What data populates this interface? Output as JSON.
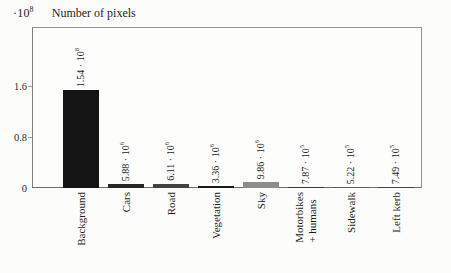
{
  "chart_data": {
    "type": "bar",
    "ylabel": "Number of pixels",
    "xlabel": "",
    "grid": false,
    "legend": "none",
    "y_axis": {
      "multiplier_base": "·10",
      "multiplier_exp": "8",
      "ticks": [
        {
          "label": "0",
          "value": 0
        },
        {
          "label": "0.8",
          "value": 80000000
        },
        {
          "label": "1.6",
          "value": 160000000
        }
      ],
      "ylim": [
        0,
        252000000
      ]
    },
    "categories": [
      "Background",
      "Cars",
      "Road",
      "Vegetation",
      "Sky",
      "Motorbikes + humans",
      "Sidewalk",
      "Left kerb"
    ],
    "values": [
      154000000,
      5880000,
      6110000,
      3360000,
      9860000,
      787000,
      522000,
      749000
    ],
    "bars": [
      {
        "category_lines": [
          "Background"
        ],
        "value": 154000000,
        "label_mantissa": "1.54 · 10",
        "label_exp": "8",
        "color": "#141414"
      },
      {
        "category_lines": [
          "Cars"
        ],
        "value": 5880000,
        "label_mantissa": "5.88 · 10",
        "label_exp": "6",
        "color": "#262626"
      },
      {
        "category_lines": [
          "Road"
        ],
        "value": 6110000,
        "label_mantissa": "6.11 · 10",
        "label_exp": "6",
        "color": "#424242"
      },
      {
        "category_lines": [
          "Vegetation"
        ],
        "value": 3360000,
        "label_mantissa": "3.36 · 10",
        "label_exp": "6",
        "color": "#1b1b1b"
      },
      {
        "category_lines": [
          "Sky"
        ],
        "value": 9860000,
        "label_mantissa": "9.86 · 10",
        "label_exp": "6",
        "color": "#8d8d8d"
      },
      {
        "category_lines": [
          "Motorbikes",
          "+ humans"
        ],
        "value": 787000,
        "label_mantissa": "7.87 · 10",
        "label_exp": "5",
        "color": "#3a3a3a"
      },
      {
        "category_lines": [
          "Sidewalk"
        ],
        "value": 522000,
        "label_mantissa": "5.22 · 10",
        "label_exp": "5",
        "color": "#5a5a5a"
      },
      {
        "category_lines": [
          "Left kerb"
        ],
        "value": 749000,
        "label_mantissa": "7.49 · 10",
        "label_exp": "5",
        "color": "#454545"
      }
    ]
  }
}
